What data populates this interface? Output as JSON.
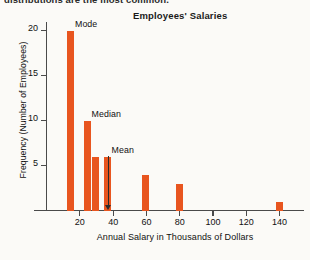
{
  "caption": {
    "clipped_line": "distributions are the most common."
  },
  "chart_data": {
    "type": "bar",
    "title": "Employees' Salaries",
    "xlabel": "Annual Salary in Thousands of Dollars",
    "ylabel": "Frequency (Number of Employees)",
    "x": [
      15,
      25,
      30,
      37,
      60,
      80,
      140
    ],
    "values": [
      20,
      10,
      6,
      6,
      4,
      3,
      1
    ],
    "categories": [
      "15",
      "25",
      "30",
      "37",
      "60",
      "80",
      "140"
    ],
    "bar_color": "#e8551f",
    "xlim": [
      0,
      155
    ],
    "ylim": [
      0,
      21
    ],
    "xticks": [
      20,
      40,
      60,
      80,
      100,
      120,
      140
    ],
    "xtick_labels": [
      "20",
      "40",
      "60",
      "80",
      "100",
      "120",
      "140"
    ],
    "yticks": [
      5,
      10,
      15,
      20
    ],
    "ytick_labels": [
      "5",
      "10",
      "15",
      "20"
    ],
    "grid": false,
    "legend": null,
    "annotations": [
      {
        "label": "Mode",
        "x": 15,
        "y": 20,
        "has_arrow": false
      },
      {
        "label": "Median",
        "x": 25,
        "y": 10,
        "has_arrow": false
      },
      {
        "label": "Mean",
        "x": 37,
        "y": 6,
        "has_arrow": true
      }
    ]
  }
}
